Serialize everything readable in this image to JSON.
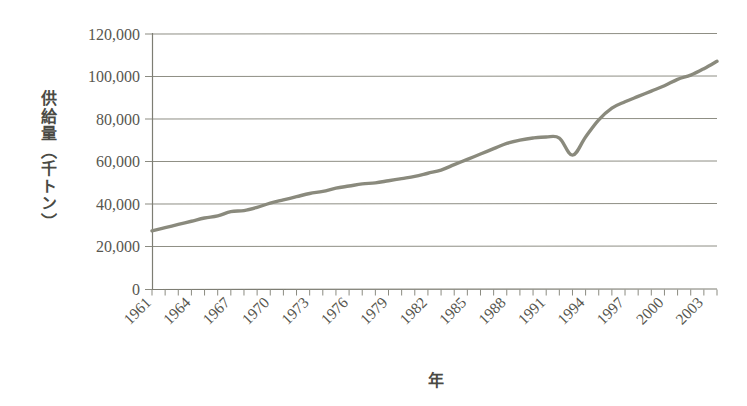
{
  "chart_data": {
    "type": "line",
    "title": "",
    "subtitle": "",
    "xlabel": "年",
    "ylabel": "供給量（千トン）",
    "ylim": [
      0,
      120000
    ],
    "xlim": [
      1961,
      2004
    ],
    "grid": true,
    "legend": null,
    "legend_position": "none",
    "series_color": "#8a8a7d",
    "ytick_labels": [
      "120,000",
      "100,000",
      "80,000",
      "60,000",
      "40,000",
      "20,000",
      "0"
    ],
    "ytick_values": [
      120000,
      100000,
      80000,
      60000,
      40000,
      20000,
      0
    ],
    "xtick_labels": [
      "1961",
      "1964",
      "1967",
      "1970",
      "1973",
      "1976",
      "1979",
      "1982",
      "1985",
      "1988",
      "1991",
      "1994",
      "1997",
      "2000",
      "2003"
    ],
    "xtick_values": [
      1961,
      1964,
      1967,
      1970,
      1973,
      1976,
      1979,
      1982,
      1985,
      1988,
      1991,
      1994,
      1997,
      2000,
      2003
    ],
    "xtick_rotation": 45,
    "x": [
      1961,
      1962,
      1963,
      1964,
      1965,
      1966,
      1967,
      1968,
      1969,
      1970,
      1971,
      1972,
      1973,
      1974,
      1975,
      1976,
      1977,
      1978,
      1979,
      1980,
      1981,
      1982,
      1983,
      1984,
      1985,
      1986,
      1987,
      1988,
      1989,
      1990,
      1991,
      1992,
      1993,
      1994,
      1995,
      1996,
      1997,
      1998,
      1999,
      2000,
      2001,
      2002,
      2003,
      2004
    ],
    "series": [
      {
        "name": "供給量",
        "values": [
          27500,
          29000,
          30500,
          32000,
          33500,
          34500,
          36500,
          37000,
          38500,
          40500,
          42000,
          43500,
          45000,
          46000,
          47500,
          48500,
          49500,
          50000,
          51000,
          52000,
          53000,
          54500,
          56000,
          58500,
          61000,
          63500,
          66000,
          68500,
          70000,
          71000,
          71500,
          71000,
          63000,
          71500,
          79500,
          85000,
          88000,
          90500,
          93000,
          95500,
          98500,
          100500,
          103500,
          107000
        ]
      }
    ]
  }
}
